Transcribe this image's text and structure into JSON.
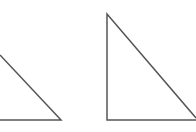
{
  "diagram": {
    "background": "#ffffff",
    "stroke_color": "#555555",
    "stroke_width": 1.5,
    "shapes": [
      {
        "name": "left-triangle",
        "type": "triangle",
        "points": [
          [
            0,
            55
          ],
          [
            61,
            120
          ],
          [
            0,
            120
          ]
        ],
        "clipped_left": true
      },
      {
        "name": "right-triangle",
        "type": "right-triangle",
        "points": [
          [
            107,
            14
          ],
          [
            107,
            120
          ],
          [
            196,
            120
          ]
        ],
        "clipped_right": true
      }
    ]
  }
}
